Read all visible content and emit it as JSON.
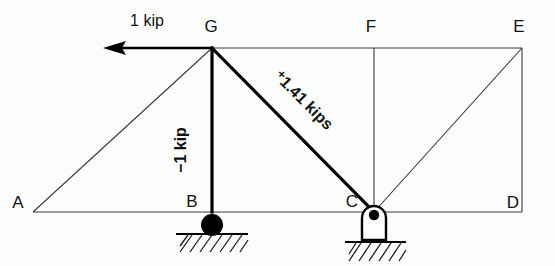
{
  "figure": {
    "type": "statics-truss-diagram",
    "width": 555,
    "height": 266,
    "background_color": "#fdfdfd",
    "line_color": "#3a3a3a",
    "bold_line_color": "#000000"
  },
  "nodes": [
    {
      "id": "A",
      "label": "A",
      "x": 33,
      "y": 212,
      "label_x": 18,
      "label_y": 208
    },
    {
      "id": "B",
      "label": "B",
      "x": 212,
      "y": 212,
      "label_x": 190,
      "label_y": 207
    },
    {
      "id": "C",
      "label": "C",
      "x": 374,
      "y": 212,
      "label_x": 350,
      "label_y": 207
    },
    {
      "id": "D",
      "label": "D",
      "x": 522,
      "y": 212,
      "label_x": 509,
      "label_y": 207
    },
    {
      "id": "E",
      "label": "E",
      "x": 522,
      "y": 48,
      "label_x": 512,
      "label_y": 30
    },
    {
      "id": "F",
      "label": "F",
      "x": 374,
      "y": 48,
      "label_x": 366,
      "label_y": 30
    },
    {
      "id": "G",
      "label": "G",
      "x": 212,
      "y": 48,
      "label_x": 204,
      "label_y": 30
    }
  ],
  "members": [
    {
      "name": "bottom-chord-AD",
      "from": "A",
      "to": "D",
      "weight": "thin"
    },
    {
      "name": "top-chord-GE",
      "from": "G",
      "to": "E",
      "weight": "thin"
    },
    {
      "name": "diagonal-AG",
      "from": "A",
      "to": "G",
      "weight": "thin"
    },
    {
      "name": "vertical-BG",
      "from": "B",
      "to": "G",
      "weight": "bold"
    },
    {
      "name": "diagonal-GC",
      "from": "G",
      "to": "C",
      "weight": "bold"
    },
    {
      "name": "vertical-CF",
      "from": "C",
      "to": "F",
      "weight": "thin"
    },
    {
      "name": "diagonal-CE",
      "from": "C",
      "to": "E",
      "weight": "thin"
    },
    {
      "name": "vertical-DE",
      "from": "D",
      "to": "E",
      "weight": "thin"
    }
  ],
  "applied_load": {
    "label": "1 kip",
    "label_x": 118,
    "label_y": 25,
    "direction": "left",
    "at_node": "G",
    "arrow_tip_x": 103,
    "arrow_tail_x": 212,
    "arrow_y": 48
  },
  "member_forces": [
    {
      "member": "vertical-BG",
      "label": "−1 kip",
      "value": -1,
      "unit": "kip",
      "sense": "compression",
      "rotation_deg": -90,
      "x": 186,
      "y": 150
    },
    {
      "member": "diagonal-GC",
      "label": "⁺1.41 kips",
      "value": 1.41,
      "unit": "kips",
      "sense": "tension",
      "rotation_deg": 45,
      "x": 262,
      "y": 86
    }
  ],
  "supports": [
    {
      "name": "support-b-roller",
      "at_node": "B",
      "type": "roller-ball",
      "circle_cx": 212,
      "circle_cy": 225,
      "circle_r": 11,
      "ground_y": 234,
      "ground_x1": 176,
      "ground_x2": 248,
      "hatch_x1": 180,
      "hatch_x2": 246,
      "hatch_y1": 234,
      "hatch_y2": 252
    },
    {
      "name": "support-c-pin",
      "at_node": "C",
      "type": "pin",
      "body_x": 362,
      "body_y": 206,
      "body_w": 24,
      "body_h": 34,
      "hole_cx": 374,
      "hole_cy": 215,
      "hole_r": 5,
      "ground_y": 242,
      "ground_x1": 345,
      "ground_x2": 406,
      "hatch_x1": 349,
      "hatch_x2": 404,
      "hatch_y1": 242,
      "hatch_y2": 261
    }
  ]
}
